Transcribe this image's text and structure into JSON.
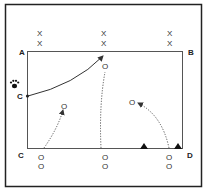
{
  "diagram": {
    "type": "drill-diagram",
    "corners": {
      "a": {
        "label": "A"
      },
      "b": {
        "label": "B"
      },
      "c_bottom": {
        "label": "C"
      },
      "c_side": {
        "label": "C"
      },
      "d": {
        "label": "D"
      }
    },
    "markers": {
      "x": "X",
      "o": "O"
    },
    "colors": {
      "line": "#333333",
      "border": "#222222",
      "cone": "#111111"
    }
  }
}
